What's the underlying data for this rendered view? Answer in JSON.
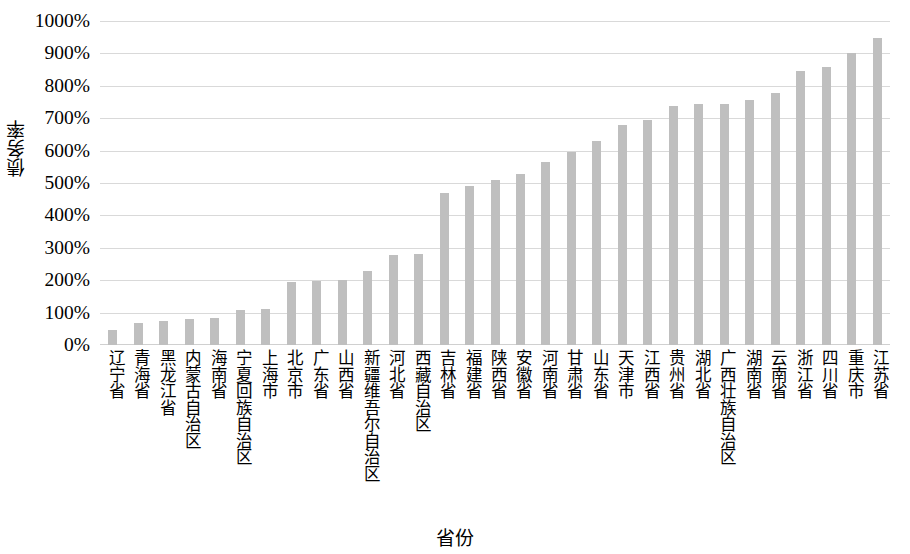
{
  "chart_data": {
    "type": "bar",
    "title": "",
    "xlabel": "省份",
    "ylabel": "债务率",
    "ylim": [
      0,
      1000
    ],
    "ytick_labels": [
      "1000%",
      "900%",
      "800%",
      "700%",
      "600%",
      "500%",
      "400%",
      "300%",
      "200%",
      "100%",
      "0%"
    ],
    "ytick_values": [
      1000,
      900,
      800,
      700,
      600,
      500,
      400,
      300,
      200,
      100,
      0
    ],
    "grid": true,
    "legend": null,
    "bar_color": "#bfbfbf",
    "gridline_color": "#d9d9d9",
    "categories": [
      "辽宁省",
      "青海省",
      "黑龙江省",
      "内蒙古自治区",
      "海南省",
      "宁夏回族自治区",
      "上海市",
      "北京市",
      "广东省",
      "山西省",
      "新疆维吾尔自治区",
      "河北省",
      "西藏自治区",
      "吉林省",
      "福建省",
      "陕西省",
      "安徽省",
      "河南省",
      "甘肃省",
      "山东省",
      "天津市",
      "江西省",
      "贵州省",
      "湖北省",
      "广西壮族自治区",
      "湖南省",
      "云南省",
      "浙江省",
      "四川省",
      "重庆市",
      "江苏省"
    ],
    "values": [
      45,
      68,
      75,
      80,
      82,
      108,
      112,
      193,
      197,
      202,
      228,
      277,
      282,
      470,
      490,
      508,
      527,
      565,
      597,
      630,
      680,
      693,
      737,
      745,
      745,
      755,
      778,
      845,
      858,
      902,
      948
    ]
  }
}
